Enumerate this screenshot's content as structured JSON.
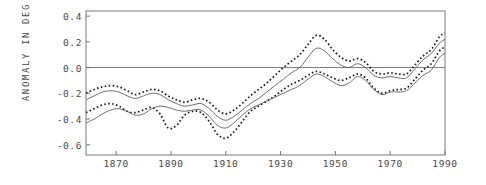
{
  "chart_data": {
    "type": "line",
    "title": "",
    "xlabel": "",
    "ylabel": "ANOMALY IN DEG C",
    "xlim": [
      1859,
      1990
    ],
    "ylim": [
      -0.68,
      0.44
    ],
    "grid": false,
    "legend": "none",
    "zero_line": 0.0,
    "yticks": [
      0.4,
      0.2,
      0.0,
      -0.2,
      -0.4,
      -0.6
    ],
    "ytick_labels": [
      "0.4",
      "0.2",
      "0.0",
      "-0.2",
      "-0.4",
      "-0.6"
    ],
    "xticks": [
      1870,
      1890,
      1910,
      1930,
      1950,
      1970,
      1990
    ],
    "xtick_labels": [
      "1870",
      "1890",
      "1910",
      "1930",
      "1950",
      "1970",
      "1990"
    ],
    "series": [
      {
        "name": "upper-dotted",
        "style": "dotted",
        "color": "#1a1a1a",
        "x": [
          1859,
          1862,
          1865,
          1868,
          1871,
          1874,
          1877,
          1880,
          1883,
          1886,
          1889,
          1892,
          1895,
          1898,
          1901,
          1904,
          1907,
          1910,
          1913,
          1916,
          1919,
          1922,
          1925,
          1928,
          1931,
          1934,
          1937,
          1940,
          1943,
          1946,
          1949,
          1952,
          1955,
          1958,
          1961,
          1964,
          1967,
          1970,
          1973,
          1976,
          1979,
          1982,
          1985,
          1988,
          1990
        ],
        "values": [
          -0.2,
          -0.17,
          -0.15,
          -0.14,
          -0.15,
          -0.18,
          -0.21,
          -0.19,
          -0.17,
          -0.18,
          -0.22,
          -0.25,
          -0.27,
          -0.25,
          -0.24,
          -0.27,
          -0.33,
          -0.36,
          -0.33,
          -0.28,
          -0.22,
          -0.17,
          -0.12,
          -0.06,
          0.0,
          0.05,
          0.1,
          0.18,
          0.25,
          0.22,
          0.14,
          0.08,
          0.05,
          0.07,
          0.04,
          -0.03,
          -0.05,
          -0.04,
          -0.05,
          -0.05,
          0.02,
          0.09,
          0.14,
          0.24,
          0.27
        ]
      },
      {
        "name": "upper-solid",
        "style": "solid",
        "color": "#555555",
        "x": [
          1859,
          1862,
          1865,
          1868,
          1871,
          1874,
          1877,
          1880,
          1883,
          1886,
          1889,
          1892,
          1895,
          1898,
          1901,
          1904,
          1907,
          1910,
          1913,
          1916,
          1919,
          1922,
          1925,
          1928,
          1931,
          1934,
          1937,
          1940,
          1943,
          1946,
          1949,
          1952,
          1955,
          1958,
          1961,
          1964,
          1967,
          1970,
          1973,
          1976,
          1979,
          1982,
          1985,
          1988,
          1990
        ],
        "values": [
          -0.25,
          -0.22,
          -0.19,
          -0.18,
          -0.19,
          -0.22,
          -0.24,
          -0.22,
          -0.2,
          -0.21,
          -0.25,
          -0.28,
          -0.3,
          -0.29,
          -0.28,
          -0.32,
          -0.38,
          -0.41,
          -0.38,
          -0.33,
          -0.28,
          -0.24,
          -0.19,
          -0.14,
          -0.09,
          -0.04,
          0.0,
          0.08,
          0.15,
          0.13,
          0.07,
          0.02,
          0.0,
          0.03,
          0.0,
          -0.06,
          -0.08,
          -0.07,
          -0.08,
          -0.08,
          -0.01,
          0.06,
          0.11,
          0.19,
          0.22
        ]
      },
      {
        "name": "lower-dotted",
        "style": "dotted",
        "color": "#1a1a1a",
        "x": [
          1859,
          1862,
          1865,
          1868,
          1871,
          1874,
          1877,
          1880,
          1883,
          1886,
          1889,
          1892,
          1895,
          1898,
          1901,
          1904,
          1907,
          1910,
          1913,
          1916,
          1919,
          1922,
          1925,
          1928,
          1931,
          1934,
          1937,
          1940,
          1943,
          1946,
          1949,
          1952,
          1955,
          1958,
          1961,
          1964,
          1967,
          1970,
          1973,
          1976,
          1979,
          1982,
          1985,
          1988,
          1990
        ],
        "values": [
          -0.35,
          -0.32,
          -0.29,
          -0.28,
          -0.3,
          -0.34,
          -0.35,
          -0.33,
          -0.31,
          -0.36,
          -0.47,
          -0.45,
          -0.37,
          -0.34,
          -0.35,
          -0.42,
          -0.52,
          -0.55,
          -0.5,
          -0.42,
          -0.34,
          -0.3,
          -0.26,
          -0.22,
          -0.17,
          -0.13,
          -0.1,
          -0.06,
          -0.03,
          -0.05,
          -0.08,
          -0.1,
          -0.08,
          -0.05,
          -0.08,
          -0.16,
          -0.2,
          -0.18,
          -0.17,
          -0.16,
          -0.09,
          -0.02,
          0.03,
          0.13,
          0.16
        ]
      },
      {
        "name": "lower-solid",
        "style": "solid",
        "color": "#555555",
        "x": [
          1859,
          1862,
          1865,
          1868,
          1871,
          1874,
          1877,
          1880,
          1883,
          1886,
          1889,
          1892,
          1895,
          1898,
          1901,
          1904,
          1907,
          1910,
          1913,
          1916,
          1919,
          1922,
          1925,
          1928,
          1931,
          1934,
          1937,
          1940,
          1943,
          1946,
          1949,
          1952,
          1955,
          1958,
          1961,
          1964,
          1967,
          1970,
          1973,
          1976,
          1979,
          1982,
          1985,
          1988,
          1990
        ],
        "values": [
          -0.43,
          -0.4,
          -0.36,
          -0.33,
          -0.32,
          -0.34,
          -0.37,
          -0.36,
          -0.32,
          -0.3,
          -0.31,
          -0.33,
          -0.34,
          -0.33,
          -0.33,
          -0.38,
          -0.45,
          -0.47,
          -0.43,
          -0.37,
          -0.32,
          -0.29,
          -0.26,
          -0.23,
          -0.2,
          -0.17,
          -0.14,
          -0.09,
          -0.05,
          -0.07,
          -0.11,
          -0.14,
          -0.12,
          -0.07,
          -0.1,
          -0.17,
          -0.21,
          -0.19,
          -0.19,
          -0.18,
          -0.12,
          -0.06,
          -0.02,
          0.08,
          0.11
        ]
      }
    ]
  },
  "axis": {
    "frame_color": "#6b6b6b",
    "zero_line_color": "#6b6b6b"
  }
}
